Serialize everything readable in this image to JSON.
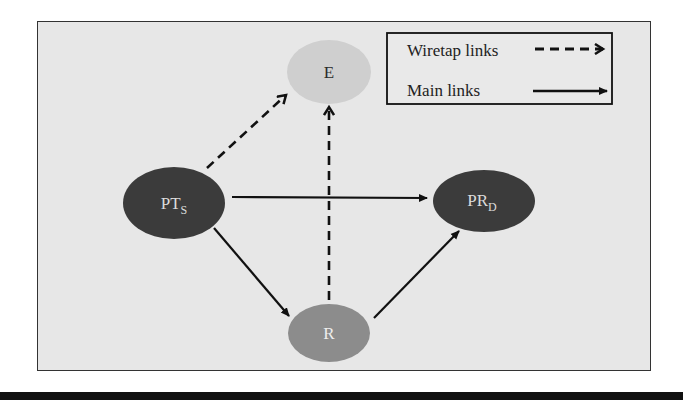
{
  "diagram": {
    "nodes": [
      {
        "id": "PTS",
        "label": "PT",
        "subscript": "S",
        "fill": "#3b3b3b",
        "text_color": "#dcdcdc"
      },
      {
        "id": "E",
        "label": "E",
        "subscript": "",
        "fill": "#cfcfcf",
        "text_color": "#2a2a2a"
      },
      {
        "id": "PRD",
        "label": "PR",
        "subscript": "D",
        "fill": "#3b3b3b",
        "text_color": "#dcdcdc"
      },
      {
        "id": "R",
        "label": "R",
        "subscript": "",
        "fill": "#8c8c8c",
        "text_color": "#eeeeee"
      }
    ],
    "edges": [
      {
        "from": "PTS",
        "to": "E",
        "type": "wiretap"
      },
      {
        "from": "R",
        "to": "E",
        "type": "wiretap"
      },
      {
        "from": "PTS",
        "to": "PRD",
        "type": "main"
      },
      {
        "from": "PTS",
        "to": "R",
        "type": "main"
      },
      {
        "from": "R",
        "to": "PRD",
        "type": "main"
      }
    ],
    "legend": {
      "wiretap_label": "Wiretap links",
      "main_label": "Main links"
    },
    "colors": {
      "background": "#e7e7e7",
      "line": "#111111"
    }
  }
}
